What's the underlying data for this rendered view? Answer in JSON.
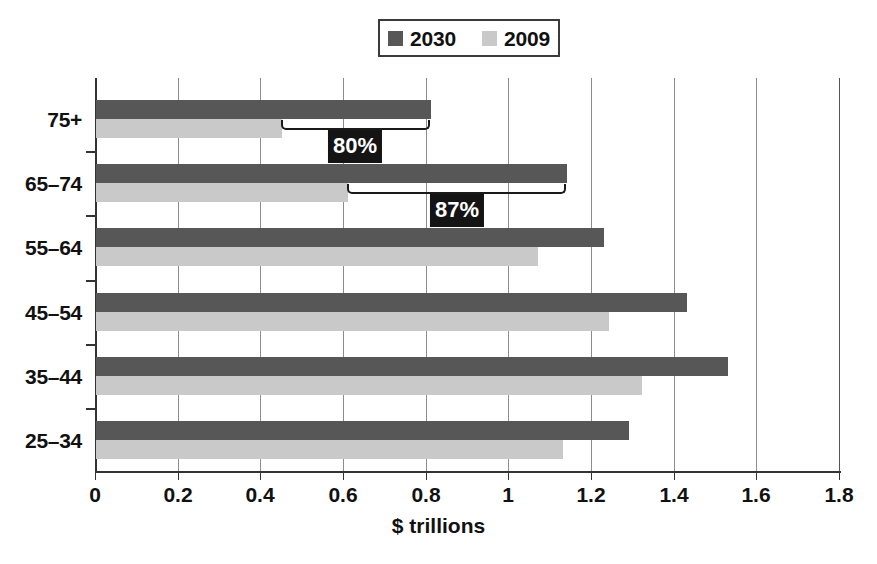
{
  "chart_data": {
    "type": "bar",
    "orientation": "horizontal",
    "title": "",
    "xlabel": "$ trillions",
    "ylabel": "",
    "xlim": [
      0,
      1.8
    ],
    "xticks": [
      "0",
      "0.2",
      "0.4",
      "0.6",
      "0.8",
      "1",
      "1.2",
      "1.4",
      "1.6",
      "1.8"
    ],
    "xtick_values": [
      0,
      0.2,
      0.4,
      0.6,
      0.8,
      1.0,
      1.2,
      1.4,
      1.6,
      1.8
    ],
    "grid": "vertical",
    "legend_position": "top-center",
    "categories": [
      "75+",
      "65–74",
      "55–64",
      "45–54",
      "35–44",
      "25–34"
    ],
    "series": [
      {
        "name": "2030",
        "color": "#575757",
        "values": [
          0.81,
          1.14,
          1.23,
          1.43,
          1.53,
          1.29
        ]
      },
      {
        "name": "2009",
        "color": "#c9c9c9",
        "values": [
          0.45,
          0.61,
          1.07,
          1.24,
          1.32,
          1.13
        ]
      }
    ],
    "annotations": [
      {
        "label": "80%",
        "category": "75+",
        "from": 0.45,
        "to": 0.81
      },
      {
        "label": "87%",
        "category": "65–74",
        "from": 0.61,
        "to": 1.14
      }
    ]
  },
  "legend": {
    "entries": [
      {
        "label": "2030",
        "color": "#575757"
      },
      {
        "label": "2009",
        "color": "#c9c9c9"
      }
    ]
  },
  "axis": {
    "x_title": "$ trillions"
  },
  "colors": {
    "series_2030": "#575757",
    "series_2009": "#c9c9c9",
    "annotation_chip_bg": "#141414",
    "annotation_chip_text": "#ffffff",
    "axis": "#333333",
    "gridline": "#8d8d8d",
    "background": "#ffffff"
  }
}
